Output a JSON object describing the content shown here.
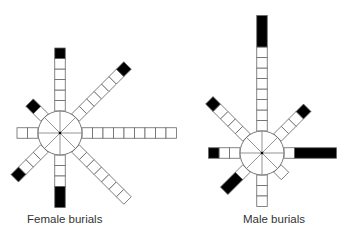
{
  "box_size": 10.5,
  "colors": {
    "line": "#666666",
    "fill_empty": "#ffffff",
    "fill_marked": "#000000"
  },
  "charts": [
    {
      "label": "Female burials",
      "center": [
        60,
        133
      ],
      "radius": 22,
      "arms": [
        {
          "dir": "N",
          "angle": -90,
          "white": 5,
          "black": 1
        },
        {
          "dir": "NE",
          "angle": -45,
          "white": 6,
          "black": 1
        },
        {
          "dir": "E",
          "angle": 0,
          "white": 9,
          "black": 0
        },
        {
          "dir": "SE",
          "angle": 45,
          "white": 7,
          "black": 0
        },
        {
          "dir": "S",
          "angle": 90,
          "white": 3,
          "black": 2
        },
        {
          "dir": "SW",
          "angle": 135,
          "white": 3,
          "black": 1
        },
        {
          "dir": "W",
          "angle": 180,
          "white": 2,
          "black": 0
        },
        {
          "dir": "NW",
          "angle": -135,
          "white": 1,
          "black": 1
        }
      ]
    },
    {
      "label": "Male burials",
      "center": [
        262,
        153
      ],
      "radius": 22,
      "arms": [
        {
          "dir": "N",
          "angle": -90,
          "white": 8,
          "black": 3
        },
        {
          "dir": "NE",
          "angle": -45,
          "white": 3,
          "black": 1
        },
        {
          "dir": "E",
          "angle": 0,
          "white": 1,
          "black": 4
        },
        {
          "dir": "SE",
          "angle": 45,
          "white": 1,
          "black": 0
        },
        {
          "dir": "S",
          "angle": 90,
          "white": 3,
          "black": 0
        },
        {
          "dir": "SW",
          "angle": 135,
          "white": 1,
          "black": 2
        },
        {
          "dir": "W",
          "angle": 180,
          "white": 2,
          "black": 1
        },
        {
          "dir": "NW",
          "angle": -135,
          "white": 4,
          "black": 1
        }
      ]
    }
  ]
}
